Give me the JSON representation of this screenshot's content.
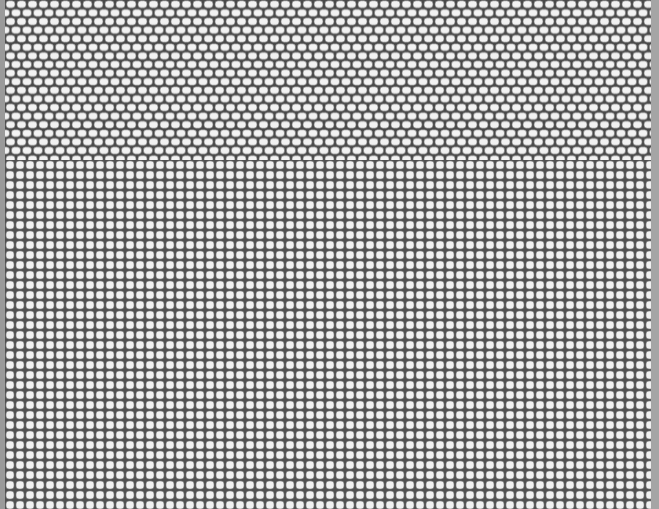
{
  "image": {
    "description": "Grayscale tiled texture of rounded white cells on a dark gray mesh; top band hexagonally offset, bottom region square grid",
    "width": 659,
    "height": 509
  },
  "regions": {
    "top": {
      "pattern": "offset-hex",
      "y_start": 0,
      "y_end": 160,
      "pitch_x": 11,
      "pitch_y": 8.6,
      "cell_w": 9,
      "cell_h": 7
    },
    "bottom": {
      "pattern": "square-grid",
      "y_start": 160,
      "y_end": 509,
      "pitch_x": 10,
      "pitch_y": 10,
      "cell_w": 8,
      "cell_h": 8
    }
  },
  "colors": {
    "mesh": "#4a4a4a",
    "cell_fill": "#f2f2f2",
    "cell_stroke": "#6a6a6a",
    "border_left": "#9a9a9a",
    "border_right": "#a5a5a5"
  }
}
